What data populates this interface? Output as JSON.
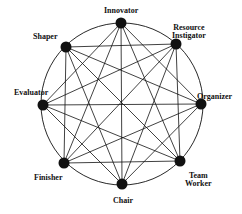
{
  "diagram": {
    "circle": {
      "cx": 122,
      "cy": 104,
      "r": 81
    },
    "nodes": [
      {
        "id": "innovator",
        "label": "Innovator",
        "x": 121,
        "y": 23
      },
      {
        "id": "resource-investigator",
        "label": "Resource Instigator",
        "label_lines": [
          "Resource",
          "Instigator"
        ],
        "x": 176,
        "y": 44
      },
      {
        "id": "organizer",
        "label": "Organizer",
        "x": 201,
        "y": 104
      },
      {
        "id": "team-worker",
        "label": "Team Worker",
        "label_lines": [
          "Team",
          "Worker"
        ],
        "x": 180,
        "y": 161
      },
      {
        "id": "chair",
        "label": "Chair",
        "x": 122,
        "y": 184
      },
      {
        "id": "finisher",
        "label": "Finisher",
        "x": 64,
        "y": 163
      },
      {
        "id": "evaluator",
        "label": "Evaluator",
        "x": 43,
        "y": 105
      },
      {
        "id": "shaper",
        "label": "Shaper",
        "x": 66,
        "y": 47
      }
    ],
    "edges": [
      [
        "innovator",
        "organizer"
      ],
      [
        "innovator",
        "team-worker"
      ],
      [
        "innovator",
        "chair"
      ],
      [
        "innovator",
        "finisher"
      ],
      [
        "innovator",
        "evaluator"
      ],
      [
        "resource-investigator",
        "team-worker"
      ],
      [
        "resource-investigator",
        "chair"
      ],
      [
        "resource-investigator",
        "finisher"
      ],
      [
        "resource-investigator",
        "evaluator"
      ],
      [
        "resource-investigator",
        "shaper"
      ],
      [
        "organizer",
        "chair"
      ],
      [
        "organizer",
        "finisher"
      ],
      [
        "organizer",
        "evaluator"
      ],
      [
        "organizer",
        "shaper"
      ],
      [
        "team-worker",
        "finisher"
      ],
      [
        "team-worker",
        "evaluator"
      ],
      [
        "team-worker",
        "shaper"
      ],
      [
        "chair",
        "evaluator"
      ],
      [
        "chair",
        "shaper"
      ],
      [
        "finisher",
        "shaper"
      ]
    ],
    "colors": {
      "line": "#111111",
      "node": "#111111",
      "background": "#ffffff"
    }
  }
}
